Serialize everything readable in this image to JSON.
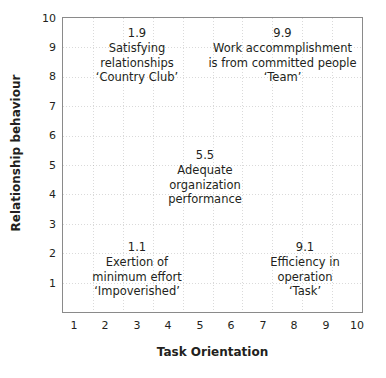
{
  "chart_data": {
    "type": "scatter",
    "title": "",
    "xlabel": "Task Orientation",
    "ylabel": "Relationship behaviour",
    "xlim": [
      0,
      10
    ],
    "ylim": [
      0,
      10
    ],
    "xticks": [
      "1",
      "2",
      "3",
      "4",
      "5",
      "6",
      "7",
      "8",
      "9",
      "10"
    ],
    "yticks": [
      "1",
      "2",
      "3",
      "4",
      "5",
      "6",
      "7",
      "8",
      "9",
      "10"
    ],
    "grid": true,
    "legend": "none",
    "points": [
      {
        "label": "1.9",
        "x": 1,
        "y": 9,
        "lines": [
          "Satisfying",
          "relationships",
          "‘Country Club’"
        ]
      },
      {
        "label": "9.9",
        "x": 9,
        "y": 9,
        "lines": [
          "Work accommplishment",
          "is from committed people",
          "‘Team’"
        ]
      },
      {
        "label": "5.5",
        "x": 5,
        "y": 5,
        "lines": [
          "Adequate",
          "organization",
          "performance"
        ]
      },
      {
        "label": "1.1",
        "x": 1,
        "y": 1,
        "lines": [
          "Exertion of",
          "minimum effort",
          "‘Impoverished’"
        ]
      },
      {
        "label": "9.1",
        "x": 9,
        "y": 1,
        "lines": [
          "Efficiency in",
          "operation",
          "‘Task’"
        ]
      }
    ],
    "colors": {
      "background": "#ffffff",
      "frame": "#8a8a8a",
      "text": "#231f20",
      "grid": "#c8c8c8"
    }
  }
}
